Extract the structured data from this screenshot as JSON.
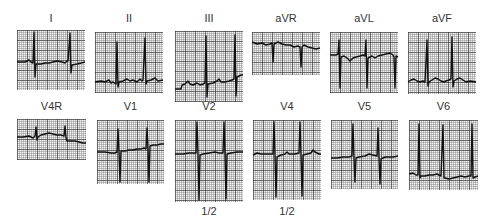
{
  "figure": {
    "type": "12-lead ECG plus V4R strip montage",
    "rows": [
      {
        "leads": [
          {
            "label": "I",
            "box": [
              17,
              30,
              68,
              60
            ]
          },
          {
            "label": "II",
            "box": [
              95,
              32,
              68,
              61
            ]
          },
          {
            "label": "III",
            "box": [
              175,
              31,
              68,
              71
            ]
          },
          {
            "label": "aVR",
            "box": [
              252,
              32,
              68,
              43
            ]
          },
          {
            "label": "aVL",
            "box": [
              330,
              32,
              68,
              61
            ]
          },
          {
            "label": "aVF",
            "box": [
              408,
              32,
              68,
              62
            ]
          }
        ]
      },
      {
        "leads": [
          {
            "label": "V4R",
            "box": [
              17,
              119,
              69,
              41
            ]
          },
          {
            "label": "V1",
            "box": [
              97,
              120,
              67,
              64
            ]
          },
          {
            "label": "V2",
            "box": [
              175,
              120,
              68,
              82
            ],
            "scale_note": "1/2"
          },
          {
            "label": "V4",
            "box": [
              253,
              120,
              68,
              80
            ],
            "scale_note": "1/2"
          },
          {
            "label": "V5",
            "box": [
              331,
              120,
              67,
              69
            ]
          },
          {
            "label": "V6",
            "box": [
              409,
              120,
              69,
              70
            ]
          }
        ]
      }
    ]
  },
  "labels": {
    "I": "I",
    "II": "II",
    "III": "III",
    "aVR": "aVR",
    "aVL": "aVL",
    "aVF": "aVF",
    "V4R": "V4R",
    "V1": "V1",
    "V2": "V2",
    "V4": "V4",
    "V5": "V5",
    "V6": "V6",
    "V2_scale": "1/2",
    "V4_scale": "1/2"
  },
  "colors": {
    "paper": "#f2f2f2",
    "grid": "#555555",
    "trace": "#111111",
    "text": "#333333"
  }
}
